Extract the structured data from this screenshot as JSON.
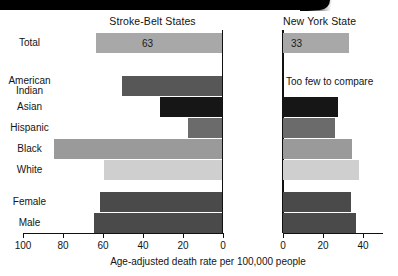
{
  "chart_data": {
    "type": "bar",
    "title": "",
    "xlabel": "Age-adjusted death rate per 100,000 people",
    "ylabel": "",
    "grid": false,
    "legend": "none",
    "orientation": "horizontal",
    "panels": [
      {
        "name": "left",
        "title": "Stroke-Belt States",
        "direction": "right-to-left",
        "xlim": [
          0,
          100
        ],
        "ticks": [
          100,
          80,
          60,
          40,
          20,
          0
        ],
        "categories": [
          "Total",
          "American Indian",
          "Asian",
          "Hispanic",
          "Black",
          "White",
          "Female",
          "Male"
        ],
        "values": [
          63,
          50,
          31,
          17,
          84,
          59,
          61,
          64
        ],
        "data_labels": [
          "63",
          "",
          "",
          "",
          "",
          "",
          "",
          ""
        ]
      },
      {
        "name": "right",
        "title": "New York State",
        "direction": "left-to-right",
        "xlim": [
          0,
          50
        ],
        "ticks": [
          0,
          20,
          40
        ],
        "categories": [
          "Total",
          "American Indian",
          "Asian",
          "Hispanic",
          "Black",
          "White",
          "Female",
          "Male"
        ],
        "values": [
          33,
          null,
          27.5,
          26,
          34.5,
          38,
          34,
          36.5
        ],
        "data_labels": [
          "33",
          "",
          "",
          "",
          "",
          "",
          "",
          ""
        ],
        "annotations": [
          {
            "category": "American Indian",
            "text": "Too few to compare"
          }
        ]
      }
    ],
    "series_colors": {
      "total": "#a8a8a8",
      "american-indian": "#575757",
      "asian": "#161616",
      "hispanic": "#6b6b6b",
      "black": "#9a9a9a",
      "white": "#cfcfcf",
      "female": "#4a4a4a",
      "male": "#4a4a4a"
    }
  },
  "panels": {
    "left": {
      "title": "Stroke-Belt States",
      "ticks": [
        {
          "label": "100",
          "x": 23
        },
        {
          "label": "80",
          "x": 63
        },
        {
          "label": "60",
          "x": 103
        },
        {
          "label": "40",
          "x": 143
        },
        {
          "label": "20",
          "x": 183
        },
        {
          "label": "0",
          "x": 223
        }
      ],
      "bars": [
        {
          "key": "total",
          "label": "63",
          "width": 126,
          "top": 33,
          "color": "#a8a8a8",
          "show_value": true
        },
        {
          "key": "american-indian",
          "label": "",
          "width": 100,
          "top": 76,
          "color": "#575757",
          "show_value": false
        },
        {
          "key": "asian",
          "label": "",
          "width": 62,
          "top": 97,
          "color": "#161616",
          "show_value": false
        },
        {
          "key": "hispanic",
          "label": "",
          "width": 34,
          "top": 118,
          "color": "#6b6b6b",
          "show_value": false
        },
        {
          "key": "black",
          "label": "",
          "width": 168,
          "top": 139,
          "color": "#9a9a9a",
          "show_value": false
        },
        {
          "key": "white",
          "label": "",
          "width": 118,
          "top": 160,
          "color": "#cfcfcf",
          "show_value": false
        },
        {
          "key": "female",
          "label": "",
          "width": 122,
          "top": 192,
          "color": "#4a4a4a",
          "show_value": false
        },
        {
          "key": "male",
          "label": "",
          "width": 128,
          "top": 213,
          "color": "#4a4a4a",
          "show_value": false
        }
      ]
    },
    "right": {
      "title": "New York State",
      "ticks": [
        {
          "label": "0",
          "x": 283
        },
        {
          "label": "20",
          "x": 323
        },
        {
          "label": "40",
          "x": 363
        }
      ],
      "bars": [
        {
          "key": "total",
          "label": "33",
          "width": 66,
          "top": 33,
          "color": "#a8a8a8",
          "show_value": true
        },
        {
          "key": "asian",
          "label": "",
          "width": 55,
          "top": 97,
          "color": "#161616",
          "show_value": false
        },
        {
          "key": "hispanic",
          "label": "",
          "width": 52,
          "top": 118,
          "color": "#6b6b6b",
          "show_value": false
        },
        {
          "key": "black",
          "label": "",
          "width": 69,
          "top": 139,
          "color": "#9a9a9a",
          "show_value": false
        },
        {
          "key": "white",
          "label": "",
          "width": 76,
          "top": 160,
          "color": "#cfcfcf",
          "show_value": false
        },
        {
          "key": "female",
          "label": "",
          "width": 68,
          "top": 192,
          "color": "#4a4a4a",
          "show_value": false
        },
        {
          "key": "male",
          "label": "",
          "width": 73,
          "top": 213,
          "color": "#4a4a4a",
          "show_value": false
        }
      ],
      "note": "Too few to compare"
    }
  },
  "category_labels": [
    {
      "key": "total",
      "text": "Total",
      "top": 38
    },
    {
      "key": "american-indian",
      "text": "American Indian",
      "top": 76,
      "two_line": true
    },
    {
      "key": "asian",
      "text": "Asian",
      "top": 102
    },
    {
      "key": "hispanic",
      "text": "Hispanic",
      "top": 123
    },
    {
      "key": "black",
      "text": "Black",
      "top": 144
    },
    {
      "key": "white",
      "text": "White",
      "top": 165
    },
    {
      "key": "female",
      "text": "Female",
      "top": 197
    },
    {
      "key": "male",
      "text": "Male",
      "top": 218
    }
  ],
  "axis_caption": "Age-adjusted death rate per 100,000 people"
}
